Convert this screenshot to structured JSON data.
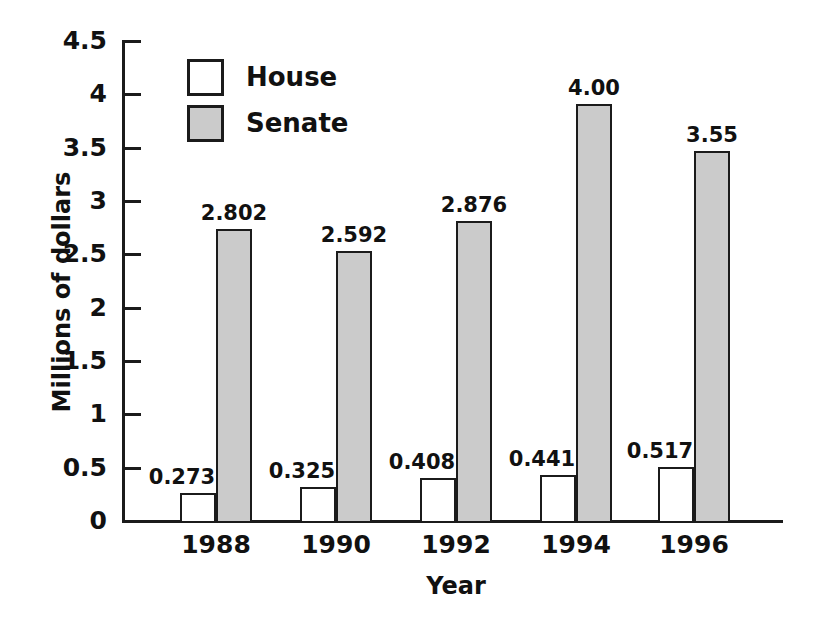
{
  "chart_data": {
    "type": "bar",
    "title": "",
    "subtitle": "",
    "xlabel": "Year",
    "ylabel": "Millions of dollars",
    "categories": [
      "1988",
      "1990",
      "1992",
      "1994",
      "1996"
    ],
    "series": [
      {
        "name": "House",
        "values": [
          0.273,
          0.325,
          0.408,
          0.441,
          0.517
        ],
        "labels": [
          "0.273",
          "0.325",
          "0.408",
          "0.441",
          "0.517"
        ],
        "color": "#ffffff"
      },
      {
        "name": "Senate",
        "values": [
          2.802,
          2.592,
          2.876,
          4.0,
          3.55
        ],
        "labels": [
          "2.802",
          "2.592",
          "2.876",
          "4.00",
          "3.55"
        ],
        "color": "#cbcbcb"
      }
    ],
    "ylim": [
      0,
      4.5
    ],
    "yticks": [
      0,
      0.5,
      1,
      1.5,
      2,
      2.5,
      3,
      3.5,
      4,
      4.5
    ],
    "ytick_labels": [
      "0",
      "0.5",
      "1",
      "1.5",
      "2",
      "2.5",
      "3",
      "3.5",
      "4",
      "4.5"
    ],
    "grid": false,
    "legend_position": "upper-left-inside",
    "legend_entries": [
      "House",
      "Senate"
    ],
    "axis_color": "#1b1b1b",
    "bar_outline_color": "#1b1b1b"
  }
}
